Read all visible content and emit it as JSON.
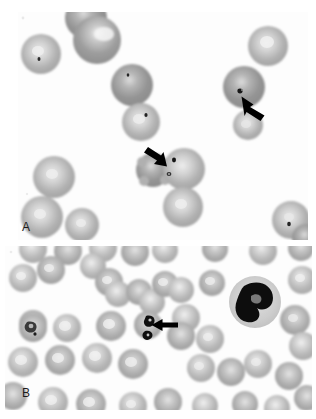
{
  "figure": {
    "type": "light-microscopy-photomicrograph",
    "modality": "peripheral blood smear, Giemsa/Wright stain, brightfield",
    "rendering": "grayscale",
    "width_px": 316,
    "height_px": 419,
    "background_color": "#ffffff",
    "panel_count": 2
  },
  "panels": [
    {
      "id": "A",
      "label": "A",
      "label_position": {
        "x": 22,
        "y": 221
      },
      "frame": {
        "x": 18,
        "y": 12,
        "w": 290,
        "h": 228
      },
      "description": "Sparse field of red blood cells at high magnification with small dark intra-erythrocytic inclusions; two black arrows indicate infected cells.",
      "cell_count_visible": 16,
      "arrow_count": 2
    },
    {
      "id": "B",
      "label": "B",
      "label_position": {
        "x": 22,
        "y": 387
      },
      "frame": {
        "x": 5,
        "y": 246,
        "w": 307,
        "h": 164
      },
      "description": "Dense field of red blood cells with a single black arrow pointing at a parasitized erythrocyte; a segmented neutrophil with dark lobed nucleus sits at the right.",
      "cell_count_visible": 52,
      "arrow_count": 1,
      "white_cell_present": true
    }
  ],
  "annotations": [
    {
      "name": "arrow-a-right",
      "panel": "A",
      "tip": {
        "x": 241,
        "y": 97
      },
      "tail": {
        "x": 264,
        "y": 114
      },
      "direction": "up-left",
      "points_at": "dark ring-form inclusion inside red blood cell"
    },
    {
      "name": "arrow-a-center",
      "panel": "A",
      "tip": {
        "x": 167,
        "y": 166
      },
      "tail": {
        "x": 145,
        "y": 152
      },
      "direction": "down-right",
      "points_at": "dark chromatin dot inside red blood cell"
    },
    {
      "name": "arrow-b-center",
      "panel": "B",
      "tip": {
        "x": 152,
        "y": 325
      },
      "tail": {
        "x": 177,
        "y": 325
      },
      "direction": "left",
      "points_at": "red blood cell containing paired dark parasite forms"
    }
  ],
  "features": {
    "erythrocyte_fill": "#b4b4b4",
    "erythrocyte_center": "#e8e8e8",
    "erythrocyte_rim": "#9a9a9a",
    "inclusion_color": "#1a1a1a",
    "leukocyte_nucleus_color": "#0d0d0d",
    "leukocyte_cytoplasm_color": "#d7d7d7",
    "arrow_color": "#000000",
    "label_color": "#1c1c1c"
  },
  "colors": {
    "page_background": "#ffffff",
    "panel_background": "#fdfdfd"
  }
}
